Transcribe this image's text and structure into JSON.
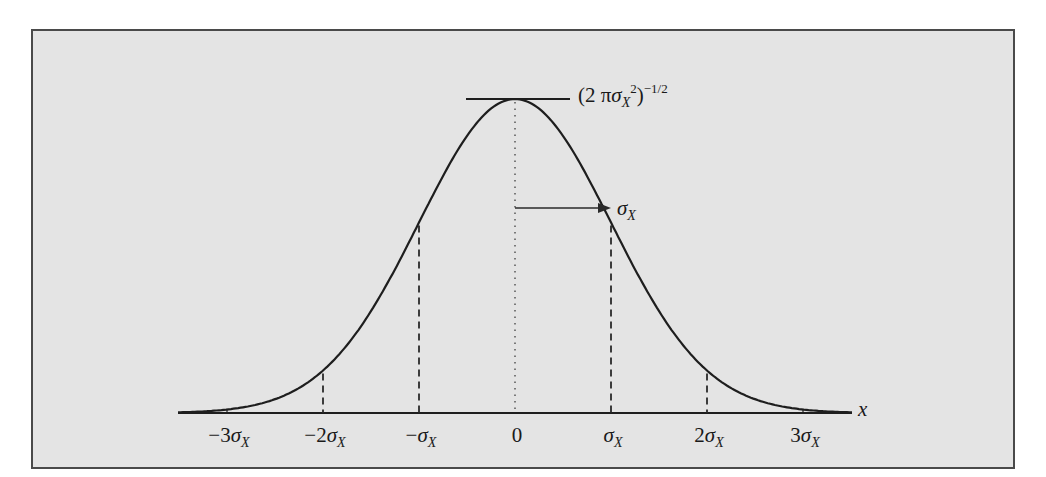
{
  "chart_data": {
    "type": "line",
    "title": "",
    "xlabel": "x",
    "ylabel": "",
    "x_ticks": [
      -3,
      -2,
      -1,
      0,
      1,
      2,
      3
    ],
    "x_tick_labels": [
      "−3σX",
      "−2σX",
      "−σX",
      "0",
      "σX",
      "2σX",
      "3σX"
    ],
    "xlim": [
      -3.5,
      3.5
    ],
    "peak_label": "(2 πσX²)^−1/2",
    "sigma_annotation": "σX",
    "series": [
      {
        "name": "normal pdf (relative to peak)",
        "x": [
          -3.5,
          -3,
          -2.5,
          -2,
          -1.5,
          -1,
          -0.5,
          0,
          0.5,
          1,
          1.5,
          2,
          2.5,
          3,
          3.5
        ],
        "values": [
          0.002,
          0.011,
          0.044,
          0.135,
          0.325,
          0.607,
          0.882,
          1.0,
          0.882,
          0.607,
          0.325,
          0.135,
          0.044,
          0.011,
          0.002
        ]
      }
    ],
    "dashed_markers_at": [
      -2,
      -1,
      1,
      2
    ],
    "dotted_center_line_at": 0,
    "grid": false,
    "legend": null
  },
  "labels": {
    "peak": {
      "prefix": "(2 π",
      "sigma": "σ",
      "sub": "X",
      "sup2": "2",
      "close": ")",
      "exp": "−1/2"
    },
    "sigma_arrow": {
      "sigma": "σ",
      "sub": "X"
    },
    "axis_var": "x",
    "ticks": [
      {
        "pre": "−3",
        "sigma": "σ",
        "sub": "X"
      },
      {
        "pre": "−2",
        "sigma": "σ",
        "sub": "X"
      },
      {
        "pre": "−",
        "sigma": "σ",
        "sub": "X"
      },
      {
        "pre": "0",
        "sigma": "",
        "sub": ""
      },
      {
        "pre": "",
        "sigma": "σ",
        "sub": "X"
      },
      {
        "pre": "2",
        "sigma": "σ",
        "sub": "X"
      },
      {
        "pre": "3",
        "sigma": "σ",
        "sub": "X"
      }
    ]
  },
  "colors": {
    "panel_bg": "#e4e4e4",
    "panel_border": "#4a4a4a",
    "curve": "#1e1e1e",
    "text": "#1a1a1a"
  }
}
